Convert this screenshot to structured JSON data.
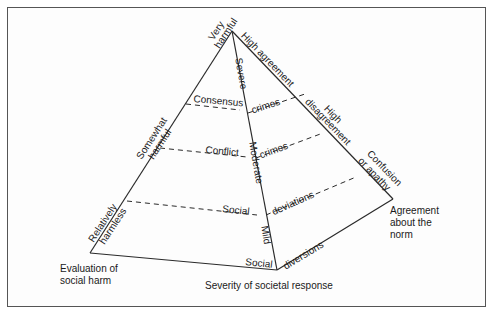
{
  "diagram": {
    "type": "pyramid",
    "colors": {
      "line": "#2a2a2a",
      "frame": "#555555",
      "text": "#1a1a1a",
      "background": "#ffffff"
    },
    "axes": {
      "social_harm": {
        "title": "Evaluation of social harm",
        "title_lines": [
          "Evaluation of",
          "social harm"
        ],
        "levels": [
          "Very harmful",
          "Somewhat harmful",
          "Relatively harmless"
        ],
        "level_lines": {
          "very": [
            "Very",
            "harmful"
          ],
          "somewhat": [
            "Somewhat",
            "harmful"
          ],
          "relatively": [
            "Relatively",
            "harmless"
          ]
        }
      },
      "societal_response": {
        "title": "Severity of societal response",
        "levels": [
          "Severe",
          "Moderate",
          "Mild"
        ]
      },
      "agreement": {
        "title": "Agreement about the norm",
        "title_lines": [
          "Agreement",
          "about the",
          "norm"
        ],
        "levels": [
          "High agreement",
          "High disagreement",
          "Confusion or apathy"
        ],
        "level_lines": {
          "high_agreement": [
            "High agreement"
          ],
          "high_disagreement": [
            "High",
            "disagreement"
          ],
          "confusion": [
            "Confusion",
            "or apathy"
          ]
        }
      }
    },
    "categories": [
      {
        "left": "Consensus",
        "right": "crimes"
      },
      {
        "left": "Conflict",
        "right": "crimes"
      },
      {
        "left": "Social",
        "right": "deviations"
      },
      {
        "left": "Social",
        "right": "diversions"
      }
    ]
  }
}
